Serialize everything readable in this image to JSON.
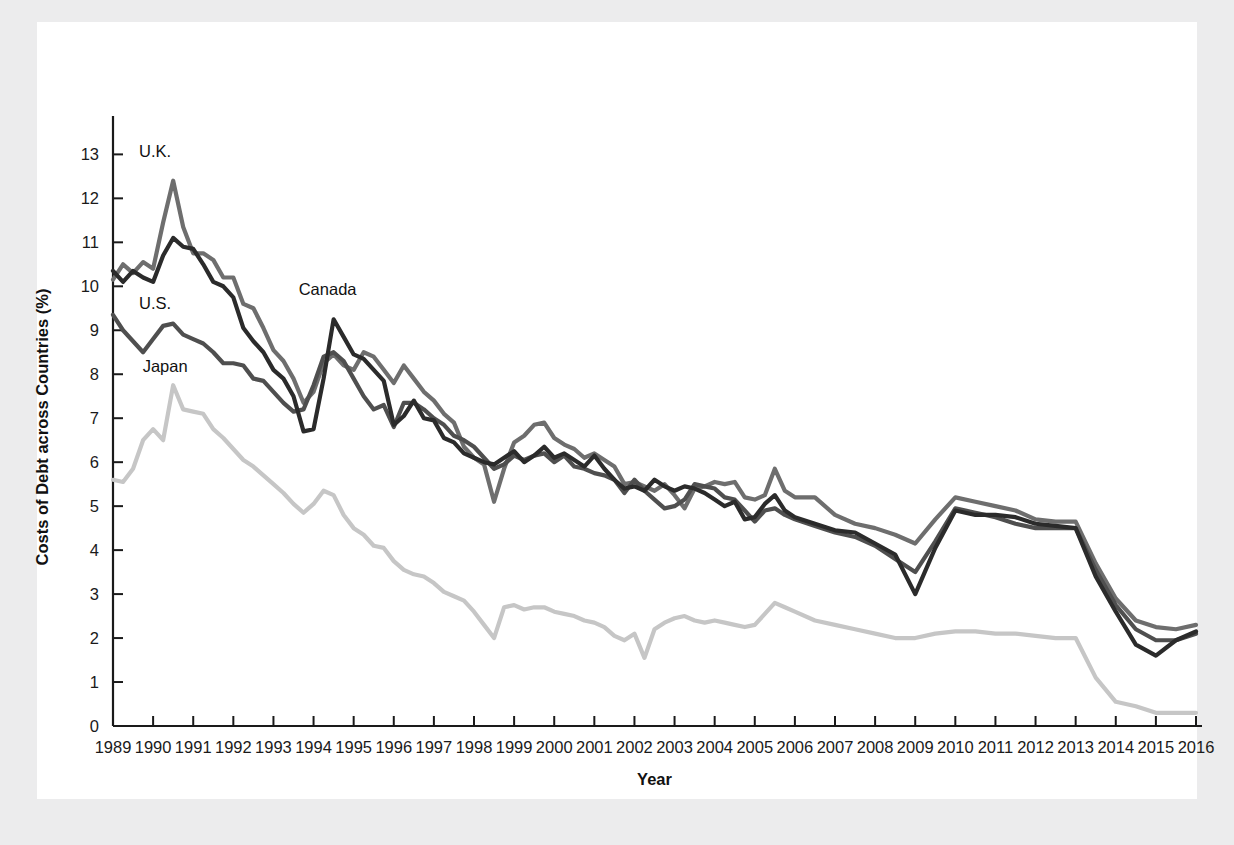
{
  "figure": {
    "background_color": "#ececed",
    "panel_color": "#ffffff"
  },
  "chart_data": {
    "type": "line",
    "title": "",
    "xlabel": "Year",
    "ylabel": "Costs of Debt across Countries (%)",
    "xlim": [
      1989,
      2016
    ],
    "ylim": [
      0,
      13.6
    ],
    "grid": false,
    "legend_position": "inline-annotations",
    "y_ticks": [
      0,
      1,
      2,
      3,
      4,
      5,
      6,
      7,
      8,
      9,
      10,
      11,
      12,
      13
    ],
    "y_tick_labels": [
      "0",
      "1",
      "2",
      "3",
      "4",
      "5",
      "6",
      "7",
      "8",
      "9",
      "10",
      "11",
      "12",
      "13"
    ],
    "x_ticks": [
      1989,
      1990,
      1991,
      1992,
      1993,
      1994,
      1995,
      1996,
      1997,
      1998,
      1999,
      2000,
      2001,
      2002,
      2003,
      2004,
      2005,
      2006,
      2007,
      2008,
      2009,
      2010,
      2011,
      2012,
      2013,
      2014,
      2015,
      2016
    ],
    "x_tick_labels": [
      "1989",
      "1990",
      "1991",
      "1992",
      "1993",
      "1994",
      "1995",
      "1996",
      "1997",
      "1998",
      "1999",
      "2000",
      "2001",
      "2002",
      "2003",
      "2004",
      "2005",
      "2006",
      "2007",
      "2008",
      "2009",
      "2010",
      "2011",
      "2012",
      "2013",
      "2014",
      "2015",
      "2016"
    ],
    "annotations": [
      {
        "text": "U.K.",
        "x": 1990.05,
        "y": 12.95,
        "series": "U.K."
      },
      {
        "text": "U.S.",
        "x": 1990.05,
        "y": 9.48,
        "series": "U.S."
      },
      {
        "text": "Japan",
        "x": 1990.3,
        "y": 8.05,
        "series": "Japan"
      },
      {
        "text": "Canada",
        "x": 1994.35,
        "y": 9.8,
        "series": "Canada"
      }
    ],
    "series": [
      {
        "name": "U.K.",
        "color": "#6e6e6e",
        "linewidth": 4.2,
        "x": [
          1989.0,
          1989.25,
          1989.5,
          1989.75,
          1990.0,
          1990.25,
          1990.5,
          1990.75,
          1991.0,
          1991.25,
          1991.5,
          1991.75,
          1992.0,
          1992.25,
          1992.5,
          1992.75,
          1993.0,
          1993.25,
          1993.5,
          1993.75,
          1994.0,
          1994.25,
          1994.5,
          1994.75,
          1995.0,
          1995.25,
          1995.5,
          1995.75,
          1996.0,
          1996.25,
          1996.5,
          1996.75,
          1997.0,
          1997.25,
          1997.5,
          1997.75,
          1998.0,
          1998.25,
          1998.5,
          1998.75,
          1999.0,
          1999.25,
          1999.5,
          1999.75,
          2000.0,
          2000.25,
          2000.5,
          2000.75,
          2001.0,
          2001.25,
          2001.5,
          2001.75,
          2002.0,
          2002.25,
          2002.5,
          2002.75,
          2003.0,
          2003.25,
          2003.5,
          2003.75,
          2004.0,
          2004.25,
          2004.5,
          2004.75,
          2005.0,
          2005.25,
          2005.5,
          2005.75,
          2006.0,
          2006.5,
          2007.0,
          2007.5,
          2008.0,
          2008.5,
          2009.0,
          2009.5,
          2010.0,
          2010.5,
          2011.0,
          2011.5,
          2012.0,
          2012.5,
          2013.0,
          2013.5,
          2014.0,
          2014.5,
          2015.0,
          2015.5,
          2016.0
        ],
        "y": [
          10.15,
          10.5,
          10.3,
          10.55,
          10.4,
          11.45,
          12.4,
          11.35,
          10.75,
          10.75,
          10.6,
          10.2,
          10.2,
          9.6,
          9.5,
          9.05,
          8.55,
          8.3,
          7.9,
          7.35,
          7.6,
          8.25,
          8.45,
          8.2,
          8.1,
          8.5,
          8.4,
          8.1,
          7.8,
          8.2,
          7.9,
          7.6,
          7.4,
          7.1,
          6.9,
          6.35,
          6.1,
          5.95,
          5.1,
          5.85,
          6.45,
          6.6,
          6.85,
          6.9,
          6.55,
          6.4,
          6.3,
          6.1,
          6.2,
          6.05,
          5.9,
          5.5,
          5.55,
          5.45,
          5.35,
          5.5,
          5.25,
          4.95,
          5.4,
          5.45,
          5.55,
          5.5,
          5.55,
          5.2,
          5.15,
          5.25,
          5.85,
          5.35,
          5.2,
          5.2,
          4.8,
          4.6,
          4.5,
          4.35,
          4.15,
          4.7,
          5.2,
          5.1,
          5.0,
          4.9,
          4.7,
          4.65,
          4.65,
          3.7,
          2.9,
          2.4,
          2.25,
          2.2,
          2.3
        ]
      },
      {
        "name": "U.S.",
        "color": "#4f4f4f",
        "linewidth": 4.2,
        "x": [
          1989.0,
          1989.25,
          1989.5,
          1989.75,
          1990.0,
          1990.25,
          1990.5,
          1990.75,
          1991.0,
          1991.25,
          1991.5,
          1991.75,
          1992.0,
          1992.25,
          1992.5,
          1992.75,
          1993.0,
          1993.25,
          1993.5,
          1993.75,
          1994.0,
          1994.25,
          1994.5,
          1994.75,
          1995.0,
          1995.25,
          1995.5,
          1995.75,
          1996.0,
          1996.25,
          1996.5,
          1996.75,
          1997.0,
          1997.25,
          1997.5,
          1997.75,
          1998.0,
          1998.25,
          1998.5,
          1998.75,
          1999.0,
          1999.25,
          1999.5,
          1999.75,
          2000.0,
          2000.25,
          2000.5,
          2000.75,
          2001.0,
          2001.25,
          2001.5,
          2001.75,
          2002.0,
          2002.25,
          2002.5,
          2002.75,
          2003.0,
          2003.25,
          2003.5,
          2003.75,
          2004.0,
          2004.25,
          2004.5,
          2004.75,
          2005.0,
          2005.25,
          2005.5,
          2005.75,
          2006.0,
          2006.5,
          2007.0,
          2007.5,
          2008.0,
          2008.5,
          2009.0,
          2009.5,
          2010.0,
          2010.5,
          2011.0,
          2011.5,
          2012.0,
          2012.5,
          2013.0,
          2013.5,
          2014.0,
          2014.5,
          2015.0,
          2015.5,
          2016.0
        ],
        "y": [
          9.35,
          9.0,
          8.75,
          8.5,
          8.8,
          9.1,
          9.15,
          8.9,
          8.8,
          8.7,
          8.5,
          8.25,
          8.25,
          8.2,
          7.9,
          7.85,
          7.6,
          7.35,
          7.15,
          7.2,
          7.75,
          8.4,
          8.5,
          8.3,
          7.9,
          7.5,
          7.2,
          7.3,
          6.8,
          7.35,
          7.35,
          7.2,
          7.0,
          6.85,
          6.6,
          6.5,
          6.35,
          6.1,
          5.85,
          5.95,
          6.15,
          6.05,
          6.15,
          6.2,
          6.0,
          6.15,
          5.9,
          5.85,
          5.75,
          5.7,
          5.6,
          5.3,
          5.6,
          5.35,
          5.15,
          4.95,
          5.0,
          5.15,
          5.5,
          5.45,
          5.4,
          5.2,
          5.15,
          4.9,
          4.65,
          4.9,
          4.95,
          4.8,
          4.7,
          4.55,
          4.4,
          4.3,
          4.1,
          3.8,
          3.5,
          4.2,
          4.95,
          4.85,
          4.75,
          4.6,
          4.5,
          4.5,
          4.5,
          3.55,
          2.75,
          2.2,
          1.95,
          1.95,
          2.1
        ]
      },
      {
        "name": "Canada",
        "color": "#2b2b2b",
        "linewidth": 4.2,
        "x": [
          1989.0,
          1989.25,
          1989.5,
          1989.75,
          1990.0,
          1990.25,
          1990.5,
          1990.75,
          1991.0,
          1991.25,
          1991.5,
          1991.75,
          1992.0,
          1992.25,
          1992.5,
          1992.75,
          1993.0,
          1993.25,
          1993.5,
          1993.75,
          1994.0,
          1994.25,
          1994.5,
          1994.75,
          1995.0,
          1995.25,
          1995.5,
          1995.75,
          1996.0,
          1996.25,
          1996.5,
          1996.75,
          1997.0,
          1997.25,
          1997.5,
          1997.75,
          1998.0,
          1998.25,
          1998.5,
          1998.75,
          1999.0,
          1999.25,
          1999.5,
          1999.75,
          2000.0,
          2000.25,
          2000.5,
          2000.75,
          2001.0,
          2001.25,
          2001.5,
          2001.75,
          2002.0,
          2002.25,
          2002.5,
          2002.75,
          2003.0,
          2003.25,
          2003.5,
          2003.75,
          2004.0,
          2004.25,
          2004.5,
          2004.75,
          2005.0,
          2005.25,
          2005.5,
          2005.75,
          2006.0,
          2006.5,
          2007.0,
          2007.5,
          2008.0,
          2008.5,
          2009.0,
          2009.5,
          2010.0,
          2010.5,
          2011.0,
          2011.5,
          2012.0,
          2012.5,
          2013.0,
          2013.5,
          2014.0,
          2014.5,
          2015.0,
          2015.5,
          2016.0
        ],
        "y": [
          10.35,
          10.1,
          10.35,
          10.2,
          10.1,
          10.7,
          11.1,
          10.9,
          10.85,
          10.5,
          10.1,
          10.0,
          9.75,
          9.05,
          8.75,
          8.5,
          8.1,
          7.9,
          7.5,
          6.7,
          6.75,
          7.9,
          9.25,
          8.85,
          8.45,
          8.35,
          8.1,
          7.85,
          6.85,
          7.05,
          7.4,
          7.0,
          6.95,
          6.55,
          6.45,
          6.2,
          6.1,
          6.0,
          5.95,
          6.1,
          6.25,
          6.0,
          6.15,
          6.35,
          6.1,
          6.2,
          6.05,
          5.9,
          6.15,
          5.85,
          5.6,
          5.4,
          5.45,
          5.35,
          5.6,
          5.45,
          5.35,
          5.45,
          5.4,
          5.3,
          5.15,
          5.0,
          5.1,
          4.7,
          4.75,
          5.05,
          5.25,
          4.9,
          4.75,
          4.6,
          4.45,
          4.4,
          4.15,
          3.9,
          3.0,
          4.05,
          4.9,
          4.8,
          4.8,
          4.75,
          4.6,
          4.55,
          4.5,
          3.4,
          2.6,
          1.85,
          1.6,
          1.95,
          2.15
        ]
      },
      {
        "name": "Japan",
        "color": "#c6c6c6",
        "linewidth": 4.2,
        "x": [
          1989.0,
          1989.25,
          1989.5,
          1989.75,
          1990.0,
          1990.25,
          1990.5,
          1990.75,
          1991.0,
          1991.25,
          1991.5,
          1991.75,
          1992.0,
          1992.25,
          1992.5,
          1992.75,
          1993.0,
          1993.25,
          1993.5,
          1993.75,
          1994.0,
          1994.25,
          1994.5,
          1994.75,
          1995.0,
          1995.25,
          1995.5,
          1995.75,
          1996.0,
          1996.25,
          1996.5,
          1996.75,
          1997.0,
          1997.25,
          1997.5,
          1997.75,
          1998.0,
          1998.25,
          1998.5,
          1998.75,
          1999.0,
          1999.25,
          1999.5,
          1999.75,
          2000.0,
          2000.25,
          2000.5,
          2000.75,
          2001.0,
          2001.25,
          2001.5,
          2001.75,
          2002.0,
          2002.25,
          2002.5,
          2002.75,
          2003.0,
          2003.25,
          2003.5,
          2003.75,
          2004.0,
          2004.25,
          2004.5,
          2004.75,
          2005.0,
          2005.25,
          2005.5,
          2005.75,
          2006.0,
          2006.5,
          2007.0,
          2007.5,
          2008.0,
          2008.5,
          2009.0,
          2009.5,
          2010.0,
          2010.5,
          2011.0,
          2011.5,
          2012.0,
          2012.5,
          2013.0,
          2013.5,
          2014.0,
          2014.5,
          2015.0,
          2015.5,
          2016.0
        ],
        "y": [
          5.6,
          5.55,
          5.85,
          6.5,
          6.75,
          6.5,
          7.75,
          7.2,
          7.15,
          7.1,
          6.75,
          6.55,
          6.3,
          6.05,
          5.9,
          5.7,
          5.5,
          5.3,
          5.05,
          4.85,
          5.05,
          5.35,
          5.25,
          4.8,
          4.5,
          4.35,
          4.1,
          4.05,
          3.75,
          3.55,
          3.45,
          3.4,
          3.25,
          3.05,
          2.95,
          2.85,
          2.6,
          2.3,
          2.0,
          2.7,
          2.75,
          2.65,
          2.7,
          2.7,
          2.6,
          2.55,
          2.5,
          2.4,
          2.35,
          2.25,
          2.05,
          1.95,
          2.1,
          1.55,
          2.2,
          2.35,
          2.45,
          2.5,
          2.4,
          2.35,
          2.4,
          2.35,
          2.3,
          2.25,
          2.3,
          2.55,
          2.8,
          2.7,
          2.6,
          2.4,
          2.3,
          2.2,
          2.1,
          2.0,
          2.0,
          2.1,
          2.15,
          2.15,
          2.1,
          2.1,
          2.05,
          2.0,
          2.0,
          1.1,
          0.55,
          0.45,
          0.3,
          0.3,
          0.3
        ]
      }
    ]
  }
}
